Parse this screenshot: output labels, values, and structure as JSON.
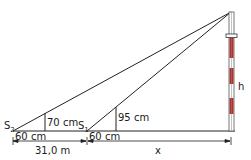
{
  "diagram": {
    "labels": {
      "s2": "S",
      "s2_sub": "2",
      "s1": "S",
      "s1_sub": "1",
      "stick2_height": "70 cm",
      "stick1_height": "95 cm",
      "offset2": "60 cm",
      "offset1": "60 cm",
      "distance": "31,0 m",
      "unknown_distance": "x",
      "mast_height": "h"
    },
    "colors": {
      "line": "#222222",
      "mast_stripe": "#b03030",
      "mast_white": "#ffffff"
    }
  }
}
